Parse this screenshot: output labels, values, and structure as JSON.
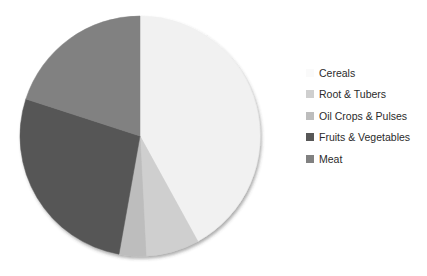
{
  "chart_data": {
    "type": "pie",
    "title": "",
    "legend_position": "right",
    "categories": [
      "Cereals",
      "Root & Tubers",
      "Oil Crops & Pulses",
      "Fruits & Vegetables",
      "Meat"
    ],
    "values": [
      42.0,
      7.2,
      3.6,
      27.2,
      20.0
    ],
    "units": "percent",
    "colors": [
      "#F1F1F1",
      "#CFCFCF",
      "#BDBDBD",
      "#575757",
      "#818181"
    ],
    "start_angle_deg": 0,
    "direction": "clockwise",
    "slices": [
      {
        "label": "Cereals",
        "value": 42.0,
        "color": "#F1F1F1",
        "start_deg": 0.0,
        "end_deg": 151.2
      },
      {
        "label": "Root & Tubers",
        "value": 7.2,
        "color": "#CFCFCF",
        "start_deg": 151.2,
        "end_deg": 177.1
      },
      {
        "label": "Oil Crops & Pulses",
        "value": 3.6,
        "color": "#BDBDBD",
        "start_deg": 177.1,
        "end_deg": 190.1
      },
      {
        "label": "Fruits & Vegetables",
        "value": 27.2,
        "color": "#575757",
        "start_deg": 190.1,
        "end_deg": 288.0
      },
      {
        "label": "Meat",
        "value": 20.0,
        "color": "#818181",
        "start_deg": 288.0,
        "end_deg": 360.0
      }
    ],
    "geometry": {
      "center_x": 140,
      "center_y": 136,
      "radius": 120
    }
  },
  "legend": {
    "items": [
      {
        "label": "Cereals",
        "color": "#FAFAFA"
      },
      {
        "label": "Root & Tubers",
        "color": "#CFCFCF"
      },
      {
        "label": "Oil Crops & Pulses",
        "color": "#BDBDBD"
      },
      {
        "label": "Fruits & Vegetables",
        "color": "#575757"
      },
      {
        "label": "Meat",
        "color": "#818181"
      }
    ]
  },
  "background": {
    "bleed_text": [
      "to the ability of",
      "able to the eco",
      "in the substit",
      "of household u",
      "a proportional compo",
      "lies to be derived from"
    ]
  }
}
